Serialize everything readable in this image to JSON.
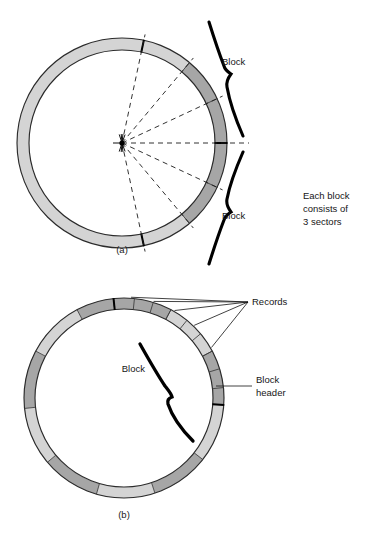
{
  "figure": {
    "background_color": "#ffffff",
    "width": 382,
    "height": 539
  },
  "colors": {
    "ring_light": "#d4d4d4",
    "ring_dark": "#a6a6a6",
    "outline": "#2b2b2b",
    "text": "#161616",
    "squiggle": "#000000",
    "dashed_line": "#1c1c1c",
    "header_tick": "#000000"
  },
  "side_note": {
    "line1": "Each block",
    "line2": "consists of",
    "line3": "3 sectors"
  },
  "panel_a": {
    "caption": "(a)",
    "center": {
      "x": 122,
      "y": 143
    },
    "outer_radius": 105,
    "inner_radius": 93,
    "block_label_top": "Block",
    "block_label_bottom": "Block",
    "sector_boundary_angles_deg": [
      -78,
      -50,
      -25,
      0,
      25,
      50,
      78
    ],
    "dark_arc_spans_deg": [
      {
        "start": -50,
        "end": 0
      },
      {
        "start": 0,
        "end": 50
      }
    ],
    "hard_tick_angles_deg": [
      -78,
      0,
      78
    ],
    "radial_dash_angles_deg": [
      -78,
      -50,
      -25,
      0,
      25,
      50,
      78
    ],
    "hub_burst_angles_deg": [
      -108,
      -95,
      -84,
      -70,
      70,
      84,
      95,
      108,
      180
    ],
    "labels": {
      "top_block_x": 222,
      "top_block_y": 65,
      "bottom_block_x": 222,
      "bottom_block_y": 219
    }
  },
  "panel_b": {
    "caption": "(b)",
    "center": {
      "x": 124,
      "y": 398
    },
    "outer_radius": 100,
    "inner_radius": 89,
    "block_label": "Block",
    "records_label": "Records",
    "block_header_label_line1": "Block",
    "block_header_label_line2": "header",
    "block_arcs": [
      {
        "start": -96,
        "end": -62,
        "shade": "dark"
      },
      {
        "start": -62,
        "end": -28,
        "shade": "light"
      },
      {
        "start": -28,
        "end": 4,
        "shade": "dark"
      },
      {
        "start": 4,
        "end": 38,
        "shade": "light"
      },
      {
        "start": 38,
        "end": 72,
        "shade": "dark"
      },
      {
        "start": 72,
        "end": 106,
        "shade": "light"
      },
      {
        "start": 106,
        "end": 140,
        "shade": "dark"
      },
      {
        "start": 140,
        "end": 174,
        "shade": "light"
      },
      {
        "start": 174,
        "end": 208,
        "shade": "dark"
      },
      {
        "start": 208,
        "end": 242,
        "shade": "light"
      },
      {
        "start": 242,
        "end": 264,
        "shade": "dark"
      }
    ],
    "record_divider_angles_deg": [
      -84,
      -73,
      -62,
      -51,
      -40,
      -28,
      -17,
      -6
    ],
    "header_tick_angles_deg": [
      4,
      -96
    ],
    "records_leader_target": {
      "x": 248,
      "y": 302
    },
    "records_leader_source_angles_deg": [
      -86,
      -73,
      -60,
      -46,
      -30
    ],
    "block_header_leader": {
      "x1": 216,
      "y1": 386,
      "x2": 252,
      "y2": 386
    },
    "labels": {
      "block_x": 145,
      "block_y": 372,
      "records_x": 252,
      "records_y": 305,
      "header_x": 256,
      "header_y": 383
    }
  }
}
